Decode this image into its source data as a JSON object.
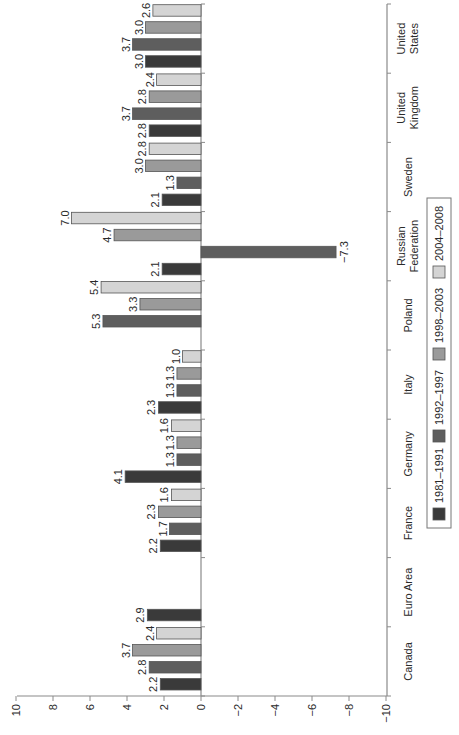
{
  "chart_data": {
    "type": "bar",
    "orientation": "rotated 90 degrees counter-clockwise (category axis runs bottom-to-top on page)",
    "title": "",
    "xlabel": "",
    "ylabel": "",
    "ylim": [
      -10,
      10
    ],
    "yticks": [
      10,
      8,
      6,
      4,
      2,
      0,
      -2,
      -4,
      -6,
      -8,
      -10
    ],
    "ytick_labels": [
      "10",
      "8",
      "6",
      "4",
      "2",
      "0",
      "−2",
      "−4",
      "−6",
      "−8",
      "−10"
    ],
    "grid": false,
    "legend_position": "right side, rotated, between Germany and Sweden",
    "categories": [
      "Canada",
      "Euro Area",
      "France",
      "Germany",
      "Italy",
      "Poland",
      "Russian Federation",
      "Sweden",
      "United Kingdom",
      "United States"
    ],
    "category_label_lines": [
      [
        "Canada"
      ],
      [
        "Euro Area"
      ],
      [
        "France"
      ],
      [
        "Germany"
      ],
      [
        "Italy"
      ],
      [
        "Poland"
      ],
      [
        "Russian",
        "Federation"
      ],
      [
        "Sweden"
      ],
      [
        "United",
        "Kingdom"
      ],
      [
        "United",
        "States"
      ]
    ],
    "series": [
      {
        "name": "1981–1991",
        "color": "#3a3a3a",
        "values": [
          2.2,
          2.9,
          2.2,
          4.1,
          2.3,
          null,
          2.1,
          2.1,
          2.8,
          3.0
        ]
      },
      {
        "name": "1992–1997",
        "color": "#5e5e5e",
        "values": [
          2.8,
          null,
          1.7,
          1.3,
          1.3,
          5.3,
          -7.3,
          1.3,
          3.7,
          3.7
        ]
      },
      {
        "name": "1998–2003",
        "color": "#9a9a9a",
        "values": [
          3.7,
          null,
          2.3,
          1.3,
          1.3,
          3.3,
          4.7,
          3.0,
          2.8,
          3.0
        ]
      },
      {
        "name": "2004–2008",
        "color": "#d4d4d4",
        "values": [
          2.4,
          null,
          1.6,
          1.6,
          1.0,
          5.4,
          7.0,
          2.8,
          2.4,
          2.6
        ]
      }
    ],
    "data_labels": [
      [
        "2.2",
        "2.9",
        "2.2",
        "4.1",
        "2.3",
        "",
        "2.1",
        "2.1",
        "2.8",
        "3.0"
      ],
      [
        "2.8",
        "",
        "1.7",
        "1.3",
        "1.3",
        "5.3",
        "−7.3",
        "1.3",
        "3.7",
        "3.7"
      ],
      [
        "3.7",
        "",
        "2.3",
        "1.3",
        "1.3",
        "3.3",
        "4.7",
        "3.0",
        "2.8",
        "3.0"
      ],
      [
        "2.4",
        "",
        "1.6",
        "1.6",
        "1.0",
        "5.4",
        "7.0",
        "2.8",
        "2.4",
        "2.6"
      ]
    ]
  },
  "legend": {
    "items": [
      {
        "label": "1981–1991",
        "color": "#3a3a3a"
      },
      {
        "label": "1992–1997",
        "color": "#5e5e5e"
      },
      {
        "label": "1998–2003",
        "color": "#9a9a9a"
      },
      {
        "label": "2004–2008",
        "color": "#d4d4d4"
      }
    ]
  },
  "style": {
    "axis_color": "#8a8a8a",
    "bar_stroke": "#555555",
    "text_color": "#2a2a2a"
  }
}
